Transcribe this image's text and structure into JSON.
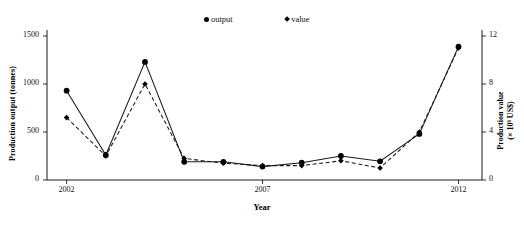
{
  "chart_data": {
    "type": "line",
    "title": "",
    "xlabel": "Year",
    "ylabel": "Production output (tonnes)",
    "y2label_line1": "Production value",
    "y2label_line2": "(× 10⁶ US$)",
    "x": [
      2002,
      2003,
      2004,
      2005,
      2006,
      2007,
      2008,
      2009,
      2010,
      2011,
      2012
    ],
    "xtick_labels": [
      "2002",
      "2007",
      "2012"
    ],
    "xticks": [
      2002,
      2007,
      2012
    ],
    "xlim": [
      2001.5,
      2012.6
    ],
    "ylim": [
      0,
      1500
    ],
    "yticks": [
      0,
      500,
      1000,
      1500
    ],
    "ytick_labels": [
      "0",
      "500",
      "1000",
      "1500"
    ],
    "y2lim": [
      0,
      12
    ],
    "y2ticks": [
      0,
      4,
      8,
      12
    ],
    "y2tick_labels": [
      "0",
      "4",
      "8",
      "12"
    ],
    "grid": false,
    "legend_position": "top-center",
    "series": [
      {
        "name": "output",
        "marker": "circle",
        "linestyle": "solid",
        "axis": "left",
        "color": "#000000",
        "values": [
          930,
          260,
          1230,
          190,
          190,
          140,
          180,
          250,
          195,
          480,
          1390
        ]
      },
      {
        "name": "value",
        "marker": "diamond",
        "linestyle": "dashed",
        "axis": "right",
        "color": "#000000",
        "values": [
          5.2,
          2.0,
          8.0,
          1.8,
          1.4,
          1.2,
          1.2,
          1.6,
          1.0,
          4.0,
          11.0
        ]
      }
    ]
  },
  "legend": {
    "output_label": "output",
    "value_label": "value"
  }
}
